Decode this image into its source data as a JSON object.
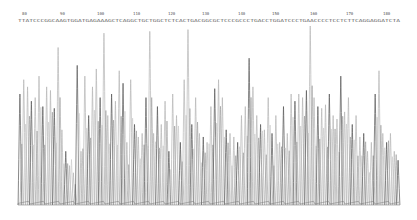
{
  "chart_data": {
    "type": "line",
    "title": "",
    "subtitle": "DNA sequencing chromatogram (electropherogram trace)",
    "xlabel": "",
    "ylabel": "",
    "grid": false,
    "legend": "none",
    "position_ticks": [
      80,
      90,
      100,
      110,
      120,
      130,
      140,
      150,
      160,
      170,
      180
    ],
    "tick_x_px": [
      22,
      60,
      97,
      133,
      168,
      202,
      238,
      272,
      310,
      346,
      383
    ],
    "base_calls": "TTATCCCGGCAAGTGGATGAGAAAGCTCAGGCTGCTGGCTCTCACTGACGGCGCTCCCGCCCTGACCTGGATCCCTGAACCCCTCCTCTTCAGGAGGATCTA",
    "plot_area": {
      "x0": 18,
      "x1": 400,
      "top": 26,
      "baseline": 205
    },
    "peaks_relative_height": [
      0.62,
      0.7,
      0.66,
      0.58,
      0.6,
      0.72,
      0.55,
      0.66,
      0.64,
      0.54,
      0.88,
      0.42,
      0.3,
      0.22,
      0.18,
      0.78,
      0.3,
      0.72,
      0.5,
      0.66,
      0.76,
      0.6,
      0.96,
      0.5,
      0.62,
      0.58,
      0.75,
      0.68,
      0.35,
      0.7,
      0.45,
      0.38,
      0.4,
      0.6,
      0.97,
      0.4,
      0.55,
      0.45,
      0.58,
      0.3,
      0.62,
      0.5,
      0.35,
      0.7,
      0.98,
      0.45,
      0.6,
      0.4,
      0.38,
      0.35,
      0.55,
      0.65,
      0.7,
      0.6,
      0.42,
      0.4,
      0.38,
      0.35,
      0.5,
      0.55,
      0.82,
      0.66,
      0.5,
      0.45,
      0.42,
      0.6,
      0.4,
      0.5,
      0.35,
      0.55,
      0.4,
      0.62,
      0.58,
      0.62,
      0.6,
      0.64,
      1.0,
      0.6,
      0.55,
      0.54,
      0.56,
      0.62,
      0.5,
      0.48,
      0.72,
      0.52,
      0.6,
      0.45,
      0.5,
      0.38,
      0.4,
      0.3,
      0.35,
      0.62,
      0.75,
      0.4,
      0.35,
      0.4,
      0.3,
      0.25
    ],
    "colors": {
      "trace_dark": "#555555",
      "trace_light": "#b5b5b5",
      "text": "#555555"
    }
  }
}
